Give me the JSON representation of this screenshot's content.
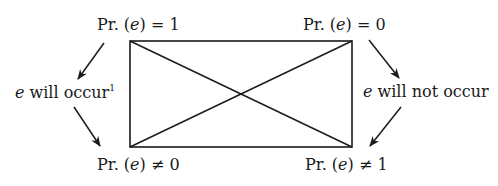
{
  "diagram": {
    "type": "square-of-opposition",
    "stroke_color": "#1a1a1a",
    "background": "#ffffff",
    "corners": {
      "top_left": {
        "prefix": "Pr. (",
        "var": "e",
        "suffix": ") = ",
        "value": "1",
        "relation": "="
      },
      "top_right": {
        "prefix": "Pr. (",
        "var": "e",
        "suffix": ") = ",
        "value": "0",
        "relation": "="
      },
      "bottom_left": {
        "prefix": "Pr. (",
        "var": "e",
        "suffix": ") ≠ ",
        "value": "0",
        "relation": "≠"
      },
      "bottom_right": {
        "prefix": "Pr. (",
        "var": "e",
        "suffix": ") ≠ ",
        "value": "1",
        "relation": "≠"
      }
    },
    "side_labels": {
      "left": {
        "var": "e",
        "text": " will occur",
        "footnote": "1"
      },
      "right": {
        "var": "e",
        "text": " will not occur"
      }
    },
    "edges": [
      {
        "from": "top_left",
        "to": "top_right",
        "kind": "line"
      },
      {
        "from": "bottom_left",
        "to": "bottom_right",
        "kind": "line"
      },
      {
        "from": "top_left",
        "to": "bottom_left",
        "kind": "line"
      },
      {
        "from": "top_right",
        "to": "bottom_right",
        "kind": "line"
      },
      {
        "from": "top_left",
        "to": "bottom_right",
        "kind": "diagonal"
      },
      {
        "from": "top_right",
        "to": "bottom_left",
        "kind": "diagonal"
      },
      {
        "from": "top_left",
        "to": "left_label",
        "kind": "arrow"
      },
      {
        "from": "left_label",
        "to": "bottom_left",
        "kind": "arrow"
      },
      {
        "from": "top_right",
        "to": "right_label",
        "kind": "arrow"
      },
      {
        "from": "right_label",
        "to": "bottom_right",
        "kind": "arrow"
      }
    ]
  }
}
